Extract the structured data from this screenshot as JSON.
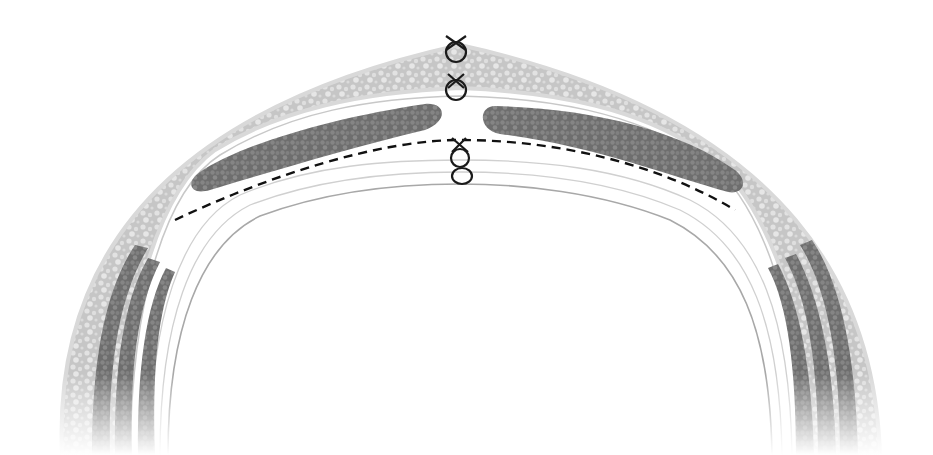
{
  "diagram": {
    "colors": {
      "background": "#ffffff",
      "fat_layer": "#c9c9c9",
      "fat_border": "#dcdcdc",
      "muscle": "#7a7a7a",
      "fascia_line": "#b0b0b0",
      "suture": "#1a1a1a",
      "dashed_line": "#111111"
    },
    "layers": [
      {
        "name": "skin-and-subcutaneous-fat",
        "texture": "cellular-light"
      },
      {
        "name": "rectus-muscle-left",
        "texture": "cellular-dark"
      },
      {
        "name": "rectus-muscle-right",
        "texture": "cellular-dark"
      },
      {
        "name": "posterior-fascia",
        "texture": "lines"
      },
      {
        "name": "lateral-muscles-left",
        "count": 3
      },
      {
        "name": "lateral-muscles-right",
        "count": 3
      }
    ],
    "sutures": [
      {
        "name": "skin-suture",
        "x": 456,
        "y": 62
      },
      {
        "name": "fascia-suture",
        "x": 456,
        "y": 98
      },
      {
        "name": "posterior-suture",
        "x": 460,
        "y": 168
      }
    ],
    "dashed_line": {
      "label": "",
      "style": "dashed"
    }
  }
}
